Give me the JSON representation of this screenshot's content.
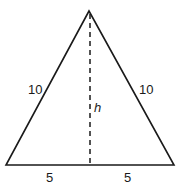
{
  "diagram": {
    "type": "isosceles-triangle",
    "sides": {
      "left": "10",
      "right": "10"
    },
    "base_segments": {
      "left": "5",
      "right": "5"
    },
    "height_label": "h",
    "colors": {
      "stroke": "#1a1a1a",
      "background": "#ffffff"
    }
  }
}
